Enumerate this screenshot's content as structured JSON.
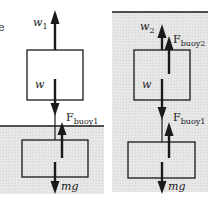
{
  "diagram": {
    "type": "free-body diagram",
    "colors": {
      "water": "#e6e6e6",
      "line": "#1a1a1a",
      "background": "#ffffff"
    },
    "left_panel": {
      "edge_glyph": "e",
      "upper_block": {
        "forces": [
          {
            "label": "w",
            "subscript": "1",
            "direction": "up"
          },
          {
            "label": "w",
            "subscript": "",
            "direction": "down"
          }
        ]
      },
      "lower_block": {
        "submerged": true,
        "forces": [
          {
            "label": "F",
            "subscript": "buoy1",
            "direction": "up"
          },
          {
            "label": "mg",
            "subscript": "",
            "direction": "down"
          }
        ]
      }
    },
    "right_panel": {
      "upper_block": {
        "submerged": true,
        "forces": [
          {
            "label": "w",
            "subscript": "2",
            "direction": "up"
          },
          {
            "label": "F",
            "subscript": "buoy2",
            "direction": "up"
          },
          {
            "label": "w",
            "subscript": "",
            "direction": "down"
          }
        ]
      },
      "lower_block": {
        "submerged": true,
        "forces": [
          {
            "label": "F",
            "subscript": "buoy1",
            "direction": "up"
          },
          {
            "label": "mg",
            "subscript": "",
            "direction": "down"
          }
        ]
      }
    }
  }
}
